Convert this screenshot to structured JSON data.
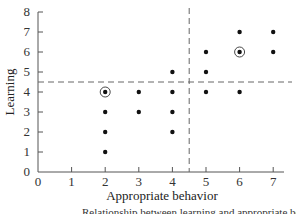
{
  "chart_data": {
    "type": "scatter",
    "title": "",
    "xlabel": "Appropriate behavior",
    "ylabel": "Learning",
    "xlim": [
      0,
      7
    ],
    "ylim": [
      0,
      8
    ],
    "x_ticks": [
      0,
      1,
      2,
      3,
      4,
      5,
      6,
      7
    ],
    "y_ticks": [
      0,
      1,
      2,
      3,
      4,
      5,
      6,
      7,
      8
    ],
    "grid": false,
    "legend": null,
    "series": [
      {
        "name": "observations",
        "points": [
          {
            "x": 2,
            "y": 4,
            "circled": true
          },
          {
            "x": 2,
            "y": 3
          },
          {
            "x": 2,
            "y": 2
          },
          {
            "x": 2,
            "y": 1
          },
          {
            "x": 3,
            "y": 4
          },
          {
            "x": 3,
            "y": 3
          },
          {
            "x": 4,
            "y": 5
          },
          {
            "x": 4,
            "y": 4
          },
          {
            "x": 4,
            "y": 3
          },
          {
            "x": 4,
            "y": 2
          },
          {
            "x": 5,
            "y": 6
          },
          {
            "x": 5,
            "y": 5
          },
          {
            "x": 5,
            "y": 4
          },
          {
            "x": 6,
            "y": 7
          },
          {
            "x": 6,
            "y": 6,
            "circled": true
          },
          {
            "x": 6,
            "y": 4
          },
          {
            "x": 7,
            "y": 7
          },
          {
            "x": 7,
            "y": 6
          }
        ]
      }
    ],
    "reference_lines": [
      {
        "orientation": "horizontal",
        "value": 4.5,
        "style": "dashed"
      },
      {
        "orientation": "vertical",
        "value": 4.5,
        "style": "dashed"
      }
    ],
    "annotations": [
      "circled points at (2,4) and (6,6)"
    ]
  },
  "caption": "Relationship between learning and appropriate behavior"
}
